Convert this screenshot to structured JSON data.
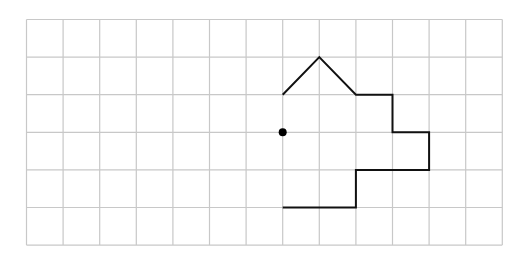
{
  "diagram": {
    "type": "grid-shape",
    "grid": {
      "columns": 13,
      "rows": 6,
      "origin_px": [
        26.5,
        19.5
      ],
      "cell_width_px": 36.6,
      "cell_height_px": 37.6,
      "line_color": "#c8c8c8",
      "line_width": 1.2
    },
    "shape": {
      "stroke_color": "#111111",
      "stroke_width": 2,
      "closed": false,
      "vertices_grid": [
        [
          7,
          2
        ],
        [
          8,
          1
        ],
        [
          9,
          2
        ],
        [
          10,
          2
        ],
        [
          10,
          3
        ],
        [
          11,
          3
        ],
        [
          11,
          4
        ],
        [
          9,
          4
        ],
        [
          9,
          5
        ],
        [
          7,
          5
        ]
      ]
    },
    "point": {
      "grid": [
        7,
        3
      ],
      "radius_px": 4,
      "color": "#000000"
    },
    "background": "#ffffff"
  }
}
